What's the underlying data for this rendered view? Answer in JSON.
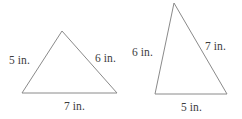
{
  "figure": {
    "background_color": "#ffffff",
    "stroke_color": "#8a8a8a",
    "text_color": "#3d3d3d",
    "unit": "in.",
    "triangles": [
      {
        "id": "left-triangle",
        "name": "Triangle 1",
        "vertices": [
          {
            "name": "apex",
            "x": 62,
            "y": 31
          },
          {
            "name": "bottom-left",
            "x": 22,
            "y": 93
          },
          {
            "name": "bottom-right",
            "x": 117,
            "y": 93
          }
        ],
        "labels": {
          "left_side": "5 in.",
          "right_side": "6 in.",
          "base": "7 in."
        }
      },
      {
        "id": "right-triangle",
        "name": "Triangle 2",
        "vertices": [
          {
            "name": "apex",
            "x": 174,
            "y": 3
          },
          {
            "name": "bottom-left",
            "x": 155,
            "y": 94
          },
          {
            "name": "bottom-right",
            "x": 227,
            "y": 94
          }
        ],
        "labels": {
          "left_side": "6 in.",
          "right_side": "7 in.",
          "base": "5 in."
        }
      }
    ]
  }
}
